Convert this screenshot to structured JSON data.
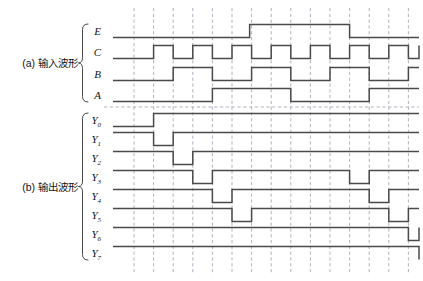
{
  "figure": {
    "title": "",
    "background_color": "#ffffff",
    "wave_color": "#4a4a4a",
    "grid_color": "#9aa0ad"
  },
  "groups": [
    {
      "id": "a",
      "label": "(a) 输入波形",
      "signals": [
        "E",
        "C",
        "B",
        "A"
      ]
    },
    {
      "id": "b",
      "label": "(b) 输出波形",
      "signals": [
        "Y0",
        "Y1",
        "Y2",
        "Y3",
        "Y4",
        "Y5",
        "Y6",
        "Y7"
      ]
    }
  ],
  "signal_labels": [
    {
      "name": "E",
      "base": "E",
      "sub": ""
    },
    {
      "name": "C",
      "base": "C",
      "sub": ""
    },
    {
      "name": "B",
      "base": "B",
      "sub": ""
    },
    {
      "name": "A",
      "base": "A",
      "sub": ""
    },
    {
      "name": "Y0",
      "base": "Y",
      "sub": "0"
    },
    {
      "name": "Y1",
      "base": "Y",
      "sub": "1"
    },
    {
      "name": "Y2",
      "base": "Y",
      "sub": "2"
    },
    {
      "name": "Y3",
      "base": "Y",
      "sub": "3"
    },
    {
      "name": "Y4",
      "base": "Y",
      "sub": "4"
    },
    {
      "name": "Y5",
      "base": "Y",
      "sub": "5"
    },
    {
      "name": "Y6",
      "base": "Y",
      "sub": "6"
    },
    {
      "name": "Y7",
      "base": "Y",
      "sub": "7"
    }
  ],
  "chart_data": {
    "type": "line",
    "xlabel": "",
    "ylabel": "",
    "grid": true,
    "legend": "none",
    "time_axis": {
      "units": "clock half-periods",
      "start": 0,
      "end": 16,
      "gridline_count": 15,
      "gridline_interval": 1
    },
    "notes": [
      "C 为时钟, 每个栅格为半周期",
      "B 为 C 的二分频, A 为 B 的二分频",
      "E 为使能, 高电平期间译码器输出被禁止",
      "Y0..Y7 为低电平有效输出"
    ],
    "series": [
      {
        "name": "E",
        "type": "digital",
        "initial": 0,
        "transitions": [
          [
            5.9,
            1
          ],
          [
            11.0,
            0
          ]
        ]
      },
      {
        "name": "C",
        "type": "digital",
        "initial": 0,
        "transitions": [
          [
            1,
            1
          ],
          [
            2,
            0
          ],
          [
            3,
            1
          ],
          [
            4,
            0
          ],
          [
            5,
            1
          ],
          [
            6,
            0
          ],
          [
            7,
            1
          ],
          [
            8,
            0
          ],
          [
            9,
            1
          ],
          [
            10,
            0
          ],
          [
            11,
            1
          ],
          [
            12,
            0
          ],
          [
            13,
            1
          ],
          [
            14,
            0
          ],
          [
            15,
            1
          ],
          [
            15.7,
            0
          ]
        ]
      },
      {
        "name": "B",
        "type": "digital",
        "initial": 0,
        "transitions": [
          [
            2,
            1
          ],
          [
            4,
            0
          ],
          [
            6,
            1
          ],
          [
            8,
            0
          ],
          [
            10,
            1
          ],
          [
            12,
            0
          ],
          [
            14,
            1
          ]
        ]
      },
      {
        "name": "A",
        "type": "digital",
        "initial": 0,
        "transitions": [
          [
            4,
            1
          ],
          [
            8,
            0
          ],
          [
            12,
            1
          ]
        ]
      },
      {
        "name": "Y0",
        "type": "digital",
        "initial": 0,
        "transitions": [
          [
            1,
            1
          ]
        ]
      },
      {
        "name": "Y1",
        "type": "digital",
        "initial": 1,
        "transitions": [
          [
            1,
            0
          ],
          [
            2,
            1
          ]
        ]
      },
      {
        "name": "Y2",
        "type": "digital",
        "initial": 1,
        "transitions": [
          [
            2,
            0
          ],
          [
            3,
            1
          ]
        ]
      },
      {
        "name": "Y3",
        "type": "digital",
        "initial": 1,
        "transitions": [
          [
            3,
            0
          ],
          [
            4,
            1
          ],
          [
            11,
            0
          ],
          [
            12,
            1
          ]
        ]
      },
      {
        "name": "Y4",
        "type": "digital",
        "initial": 1,
        "transitions": [
          [
            4,
            0
          ],
          [
            5,
            1
          ],
          [
            12,
            0
          ],
          [
            13,
            1
          ]
        ]
      },
      {
        "name": "Y5",
        "type": "digital",
        "initial": 1,
        "transitions": [
          [
            5,
            0
          ],
          [
            6,
            1
          ],
          [
            13,
            0
          ],
          [
            14,
            1
          ]
        ]
      },
      {
        "name": "Y6",
        "type": "digital",
        "initial": 1,
        "transitions": [
          [
            14,
            0
          ],
          [
            15,
            1
          ]
        ]
      },
      {
        "name": "Y7",
        "type": "digital",
        "initial": 1,
        "transitions": [
          [
            15,
            0
          ]
        ]
      }
    ]
  },
  "geometry": {
    "wave_x_start": 113,
    "wave_x_end": 419,
    "grid_x_first": 134,
    "grid_x_step": 19.6,
    "grid_y_top": 8,
    "grid_y_bottom": 274,
    "amplitude": 13,
    "rows": {
      "E": 31,
      "C": 52,
      "B": 74,
      "A": 95,
      "Y0": 120,
      "Y1": 139,
      "Y2": 158,
      "Y3": 177,
      "Y4": 196,
      "Y5": 215,
      "Y6": 234,
      "Y7": 253
    },
    "separator_y": 107
  }
}
